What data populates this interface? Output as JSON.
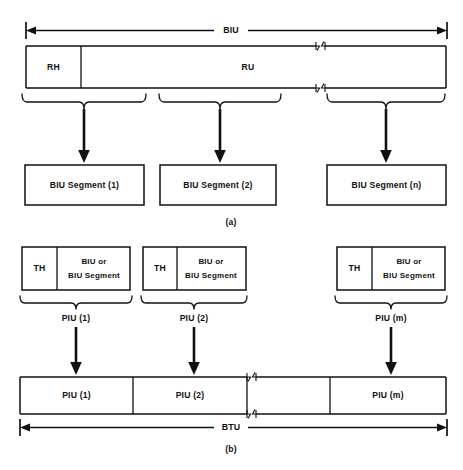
{
  "figure": {
    "part_a": {
      "label": "(a)",
      "dimension_label": "BIU",
      "bar_fields": [
        {
          "name": "RH",
          "label": "RH"
        },
        {
          "name": "RU",
          "label": "RU"
        }
      ],
      "segments": [
        {
          "label": "BIU Segment (1)"
        },
        {
          "label": "BIU Segment (2)"
        },
        {
          "label": "BIU Segment (n)"
        }
      ]
    },
    "part_b": {
      "label": "(b)",
      "dimension_label": "BTU",
      "piu_units": [
        {
          "th_label": "TH",
          "payload_line1": "BIU or",
          "payload_line2": "BIU Segment",
          "brace_label": "PIU (1)"
        },
        {
          "th_label": "TH",
          "payload_line1": "BIU or",
          "payload_line2": "BIU Segment",
          "brace_label": "PIU (2)"
        },
        {
          "th_label": "TH",
          "payload_line1": "BIU or",
          "payload_line2": "BIU Segment",
          "brace_label": "PIU (m)"
        }
      ],
      "btu_cells": [
        {
          "label": "PIU (1)"
        },
        {
          "label": "PIU (2)"
        },
        {
          "label": ""
        },
        {
          "label": "PIU (m)"
        }
      ]
    }
  },
  "colors": {
    "ink": "#111111",
    "paper": "#ffffff"
  }
}
